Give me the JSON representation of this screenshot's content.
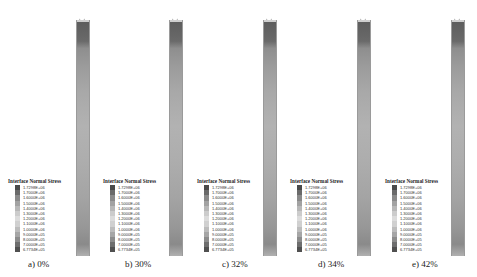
{
  "figure": {
    "legend_title": "Interface Normal Stress",
    "legend_values": [
      "1.7298E+06",
      "1.7000E+06",
      "1.6000E+06",
      "1.5000E+06",
      "1.4000E+06",
      "1.3000E+06",
      "1.2000E+06",
      "1.1000E+06",
      "1.0000E+06",
      "9.0000E+05",
      "8.0000E+05",
      "7.0000E+05",
      "6.7734E+05"
    ],
    "legend_colors": [
      "#4a4a4a",
      "#6a6a6a",
      "#8a8a8a",
      "#a2a2a2",
      "#b8b8b8",
      "#cccccc",
      "#dcdcdc",
      "#d0d0d0",
      "#bcbcbc",
      "#a6a6a6",
      "#8c8c8c",
      "#6e6e6e",
      "#505050"
    ],
    "panels": [
      {
        "caption": "a) 0%"
      },
      {
        "caption": "b) 30%"
      },
      {
        "caption": "c) 32%"
      },
      {
        "caption": "d) 34%"
      },
      {
        "caption": "e) 42%"
      }
    ]
  }
}
